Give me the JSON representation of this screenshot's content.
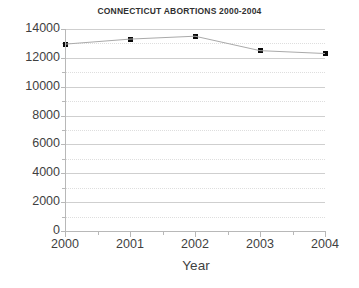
{
  "chart_data": {
    "type": "line",
    "title": "CONNECTICUT ABORTIONS 2000-2004",
    "xlabel": "Year",
    "ylabel": "",
    "categories": [
      "2000",
      "2001",
      "2002",
      "2003",
      "2004"
    ],
    "x": [
      2000,
      2001,
      2002,
      2003,
      2004
    ],
    "values": [
      12950,
      13300,
      13500,
      12500,
      12300
    ],
    "series": [
      {
        "name": "Abortions",
        "values": [
          12950,
          13300,
          13500,
          12500,
          12300
        ]
      }
    ],
    "xlim": [
      2000,
      2004
    ],
    "ylim": [
      0,
      14000
    ],
    "ytick_labels": [
      "0",
      "2000",
      "4000",
      "6000",
      "8000",
      "10000",
      "12000",
      "14000"
    ],
    "ytick_values": [
      0,
      2000,
      4000,
      6000,
      8000,
      10000,
      12000,
      14000
    ],
    "yminor_values": [
      1000,
      3000,
      5000,
      7000,
      9000,
      11000,
      13000
    ],
    "xtick_labels": [
      "2000",
      "2001",
      "2002",
      "2003",
      "2004"
    ],
    "grid": true,
    "grid_style": "solid major, dotted minor",
    "legend": false,
    "legend_position": "none",
    "marker": "square",
    "marker_color": "#0a0a0a",
    "line_color": "#aaaaaa",
    "background_color": "#ffffff",
    "axis_color": "#b8b8b8"
  }
}
